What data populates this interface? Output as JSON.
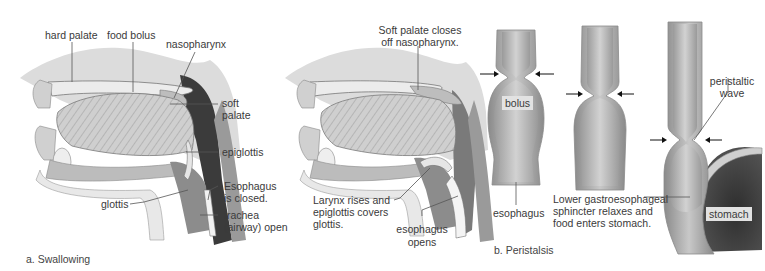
{
  "panel_a": {
    "caption": "a. Swallowing",
    "left_figure": {
      "labels": {
        "hard_palate": "hard palate",
        "food_bolus": "food bolus",
        "nasopharynx": "nasopharynx",
        "soft_palate_1": "soft",
        "soft_palate_2": "palate",
        "epiglottis": "epiglottis",
        "esophagus_closed_1": "Esophagus",
        "esophagus_closed_2": "is closed.",
        "glottis": "glottis",
        "trachea_1": "trachea",
        "trachea_2": "(airway) open"
      }
    },
    "right_figure": {
      "labels": {
        "soft_palate_closes_1": "Soft palate closes",
        "soft_palate_closes_2": "off nasopharynx.",
        "larynx_1": "Larynx rises and",
        "larynx_2": "epiglottis covers",
        "larynx_3": "glottis.",
        "esophagus_opens_1": "esophagus",
        "esophagus_opens_2": "opens"
      }
    }
  },
  "panel_b": {
    "caption": "b. Peristalsis",
    "labels": {
      "bolus": "bolus",
      "esophagus": "esophagus",
      "peristaltic_1": "peristaltic",
      "peristaltic_2": "wave",
      "sphincter_1": "Lower gastroesophageal",
      "sphincter_2": "sphincter relaxes and",
      "sphincter_3": "food enters stomach.",
      "stomach": "stomach"
    }
  },
  "colors": {
    "tissue_light": "#e6e6e6",
    "tissue_mid": "#b8b8b8",
    "tissue_dark": "#555555",
    "cavity": "#3d3d3d",
    "text": "#3a3a3a",
    "leader": "#555555"
  }
}
